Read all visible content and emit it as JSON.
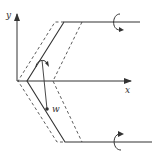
{
  "diagram": {
    "type": "beam-geometry",
    "axes": {
      "x_label": "x",
      "y_label": "y"
    },
    "displacement_label": "w",
    "colors": {
      "stroke": "#333333",
      "background": "#ffffff"
    },
    "elements": [
      "y-axis-arrow",
      "x-axis-arrow",
      "solid-centerline-zigzag",
      "dashed-left-edge",
      "dashed-right-edge",
      "top-arm-line",
      "bottom-arm-line",
      "top-moment-arrow",
      "bottom-moment-arrow",
      "middle-moment-arrow",
      "displacement-vector-w"
    ]
  }
}
